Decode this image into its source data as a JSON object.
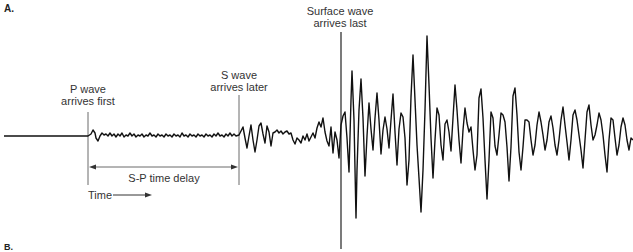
{
  "figure": {
    "panel_a_label": "A.",
    "panel_b_label": "B.",
    "annotations": {
      "p_wave_line1": "P wave",
      "p_wave_line2": "arrives first",
      "s_wave_line1": "S wave",
      "s_wave_line2": "arrives later",
      "surface_wave_line1": "Surface wave",
      "surface_wave_line2": "arrives last",
      "sp_delay": "S-P time delay",
      "time_axis": "Time"
    },
    "colors": {
      "trace": "#111111",
      "marker_lines": "#333333",
      "text": "#333333"
    },
    "markers_x": {
      "p_wave": 88,
      "s_wave": 239,
      "surface_wave": 341
    },
    "baseline_y": 136
  }
}
